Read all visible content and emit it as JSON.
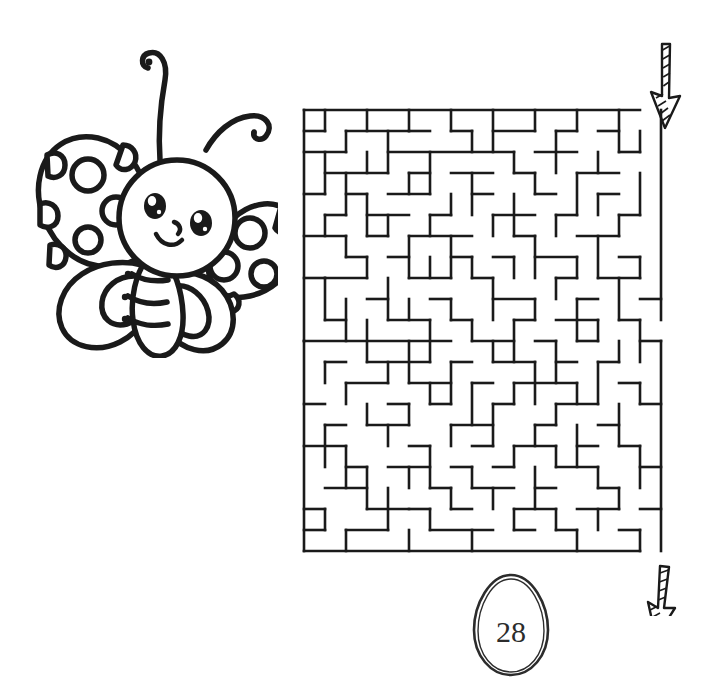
{
  "page": {
    "background_color": "#ffffff",
    "ink_color": "#1a1a1a",
    "width": 724,
    "height": 697
  },
  "illustration": {
    "name": "butterfly",
    "description": "Cartoon butterfly line drawing with polka-dot wings",
    "style": "black outline coloring-book line art",
    "parts": [
      "left-upper-wing-with-spots",
      "right-upper-wing-with-spots",
      "left-lower-wing",
      "right-lower-wing",
      "body-segments",
      "head",
      "left-eye",
      "right-eye",
      "nose",
      "smile",
      "left-antenna-curl",
      "right-antenna-curl"
    ],
    "spot_count_left_wing": 7,
    "spot_count_right_wing": 7
  },
  "maze": {
    "name": "maze-puzzle",
    "columns": 17,
    "rows": 21,
    "cell_size": 21,
    "wall_color": "#1a1a1a",
    "wall_thickness": 2.6,
    "entrance": {
      "label": "entry-arrow",
      "position": "top-right",
      "direction": "down"
    },
    "exit": {
      "label": "exit-arrow",
      "position": "bottom-right",
      "direction": "down"
    },
    "h_walls": [
      [
        0,
        0,
        16
      ],
      [
        0,
        1,
        1
      ],
      [
        2,
        1,
        3
      ],
      [
        5,
        1,
        1
      ],
      [
        7,
        1,
        1
      ],
      [
        9,
        1,
        2
      ],
      [
        12,
        1,
        1
      ],
      [
        14,
        1,
        1
      ],
      [
        0,
        2,
        2
      ],
      [
        4,
        2,
        6
      ],
      [
        11,
        2,
        2
      ],
      [
        15,
        2,
        1
      ],
      [
        1,
        3,
        3
      ],
      [
        5,
        3,
        1
      ],
      [
        7,
        3,
        2
      ],
      [
        10,
        3,
        1
      ],
      [
        13,
        3,
        2
      ],
      [
        0,
        4,
        1
      ],
      [
        2,
        4,
        1
      ],
      [
        4,
        4,
        2
      ],
      [
        8,
        4,
        1
      ],
      [
        11,
        4,
        1
      ],
      [
        14,
        4,
        1
      ],
      [
        1,
        5,
        1
      ],
      [
        3,
        5,
        2
      ],
      [
        6,
        5,
        1
      ],
      [
        9,
        5,
        2
      ],
      [
        12,
        5,
        1
      ],
      [
        15,
        5,
        1
      ],
      [
        0,
        6,
        2
      ],
      [
        3,
        6,
        1
      ],
      [
        5,
        6,
        3
      ],
      [
        10,
        6,
        1
      ],
      [
        13,
        6,
        2
      ],
      [
        2,
        7,
        1
      ],
      [
        4,
        7,
        1
      ],
      [
        7,
        7,
        1
      ],
      [
        9,
        7,
        1
      ],
      [
        11,
        7,
        2
      ],
      [
        15,
        7,
        1
      ],
      [
        0,
        8,
        1
      ],
      [
        1,
        8,
        2
      ],
      [
        5,
        8,
        2
      ],
      [
        8,
        8,
        1
      ],
      [
        12,
        8,
        1
      ],
      [
        14,
        8,
        2
      ],
      [
        3,
        9,
        1
      ],
      [
        6,
        9,
        1
      ],
      [
        9,
        9,
        2
      ],
      [
        13,
        9,
        1
      ],
      [
        16,
        9,
        1
      ],
      [
        1,
        10,
        1
      ],
      [
        4,
        10,
        2
      ],
      [
        7,
        10,
        1
      ],
      [
        10,
        10,
        1
      ],
      [
        12,
        10,
        2
      ],
      [
        15,
        10,
        1
      ],
      [
        0,
        11,
        7
      ],
      [
        8,
        11,
        2
      ],
      [
        11,
        11,
        1
      ],
      [
        13,
        11,
        1
      ],
      [
        16,
        11,
        1
      ],
      [
        1,
        12,
        1
      ],
      [
        3,
        12,
        3
      ],
      [
        7,
        12,
        1
      ],
      [
        9,
        12,
        2
      ],
      [
        12,
        12,
        1
      ],
      [
        14,
        12,
        1
      ],
      [
        2,
        13,
        2
      ],
      [
        5,
        13,
        2
      ],
      [
        8,
        13,
        1
      ],
      [
        10,
        13,
        3
      ],
      [
        15,
        13,
        1
      ],
      [
        0,
        14,
        1
      ],
      [
        4,
        14,
        1
      ],
      [
        6,
        14,
        1
      ],
      [
        9,
        14,
        1
      ],
      [
        12,
        14,
        2
      ],
      [
        16,
        14,
        1
      ],
      [
        1,
        15,
        1
      ],
      [
        3,
        15,
        2
      ],
      [
        7,
        15,
        2
      ],
      [
        11,
        15,
        1
      ],
      [
        14,
        15,
        1
      ],
      [
        0,
        16,
        2
      ],
      [
        5,
        16,
        1
      ],
      [
        8,
        16,
        1
      ],
      [
        10,
        16,
        2
      ],
      [
        13,
        16,
        1
      ],
      [
        15,
        16,
        1
      ],
      [
        2,
        17,
        1
      ],
      [
        4,
        17,
        2
      ],
      [
        7,
        17,
        1
      ],
      [
        9,
        17,
        1
      ],
      [
        12,
        17,
        2
      ],
      [
        16,
        17,
        1
      ],
      [
        1,
        18,
        2
      ],
      [
        6,
        18,
        1
      ],
      [
        8,
        18,
        2
      ],
      [
        11,
        18,
        1
      ],
      [
        14,
        18,
        1
      ],
      [
        0,
        19,
        1
      ],
      [
        3,
        19,
        2
      ],
      [
        5,
        19,
        1
      ],
      [
        7,
        19,
        1
      ],
      [
        10,
        19,
        2
      ],
      [
        13,
        19,
        2
      ],
      [
        16,
        19,
        1
      ],
      [
        0,
        20,
        1
      ],
      [
        2,
        20,
        2
      ],
      [
        6,
        20,
        3
      ],
      [
        10,
        20,
        1
      ],
      [
        12,
        20,
        1
      ],
      [
        15,
        20,
        1
      ],
      [
        0,
        21,
        16
      ]
    ],
    "v_walls": [
      [
        0,
        0,
        11
      ],
      [
        0,
        11,
        10
      ],
      [
        1,
        0,
        1
      ],
      [
        1,
        2,
        2
      ],
      [
        1,
        5,
        1
      ],
      [
        1,
        8,
        2
      ],
      [
        1,
        12,
        1
      ],
      [
        1,
        15,
        2
      ],
      [
        1,
        19,
        1
      ],
      [
        2,
        1,
        1
      ],
      [
        2,
        3,
        2
      ],
      [
        2,
        6,
        1
      ],
      [
        2,
        9,
        2
      ],
      [
        2,
        13,
        1
      ],
      [
        2,
        16,
        2
      ],
      [
        2,
        20,
        1
      ],
      [
        3,
        0,
        1
      ],
      [
        3,
        2,
        1
      ],
      [
        3,
        4,
        2
      ],
      [
        3,
        7,
        1
      ],
      [
        3,
        10,
        2
      ],
      [
        3,
        14,
        1
      ],
      [
        3,
        17,
        2
      ],
      [
        4,
        1,
        2
      ],
      [
        4,
        5,
        1
      ],
      [
        4,
        8,
        2
      ],
      [
        4,
        12,
        1
      ],
      [
        4,
        15,
        1
      ],
      [
        4,
        18,
        2
      ],
      [
        5,
        0,
        1
      ],
      [
        5,
        3,
        1
      ],
      [
        5,
        6,
        2
      ],
      [
        5,
        9,
        1
      ],
      [
        5,
        11,
        2
      ],
      [
        5,
        14,
        1
      ],
      [
        5,
        17,
        1
      ],
      [
        5,
        20,
        1
      ],
      [
        6,
        2,
        2
      ],
      [
        6,
        5,
        1
      ],
      [
        6,
        7,
        1
      ],
      [
        6,
        10,
        2
      ],
      [
        6,
        13,
        1
      ],
      [
        6,
        16,
        2
      ],
      [
        6,
        19,
        1
      ],
      [
        7,
        0,
        1
      ],
      [
        7,
        4,
        1
      ],
      [
        7,
        6,
        2
      ],
      [
        7,
        9,
        1
      ],
      [
        7,
        12,
        2
      ],
      [
        7,
        15,
        1
      ],
      [
        7,
        18,
        1
      ],
      [
        8,
        1,
        1
      ],
      [
        8,
        3,
        2
      ],
      [
        8,
        7,
        1
      ],
      [
        8,
        10,
        1
      ],
      [
        8,
        13,
        2
      ],
      [
        8,
        17,
        1
      ],
      [
        8,
        20,
        1
      ],
      [
        9,
        0,
        2
      ],
      [
        9,
        5,
        1
      ],
      [
        9,
        8,
        2
      ],
      [
        9,
        11,
        1
      ],
      [
        9,
        14,
        2
      ],
      [
        9,
        18,
        1
      ],
      [
        10,
        2,
        1
      ],
      [
        10,
        4,
        2
      ],
      [
        10,
        7,
        1
      ],
      [
        10,
        10,
        2
      ],
      [
        10,
        13,
        1
      ],
      [
        10,
        16,
        1
      ],
      [
        10,
        19,
        1
      ],
      [
        11,
        0,
        1
      ],
      [
        11,
        3,
        1
      ],
      [
        11,
        6,
        2
      ],
      [
        11,
        9,
        1
      ],
      [
        11,
        12,
        2
      ],
      [
        11,
        15,
        1
      ],
      [
        11,
        17,
        2
      ],
      [
        12,
        1,
        2
      ],
      [
        12,
        5,
        1
      ],
      [
        12,
        8,
        1
      ],
      [
        12,
        11,
        2
      ],
      [
        12,
        14,
        1
      ],
      [
        12,
        16,
        1
      ],
      [
        12,
        19,
        1
      ],
      [
        13,
        0,
        1
      ],
      [
        13,
        3,
        2
      ],
      [
        13,
        7,
        1
      ],
      [
        13,
        9,
        2
      ],
      [
        13,
        13,
        1
      ],
      [
        13,
        15,
        2
      ],
      [
        13,
        20,
        1
      ],
      [
        14,
        2,
        1
      ],
      [
        14,
        4,
        1
      ],
      [
        14,
        6,
        2
      ],
      [
        14,
        10,
        1
      ],
      [
        14,
        12,
        2
      ],
      [
        14,
        17,
        1
      ],
      [
        14,
        19,
        1
      ],
      [
        15,
        0,
        2
      ],
      [
        15,
        5,
        1
      ],
      [
        15,
        8,
        2
      ],
      [
        15,
        11,
        1
      ],
      [
        15,
        14,
        2
      ],
      [
        15,
        18,
        1
      ],
      [
        16,
        1,
        1
      ],
      [
        16,
        3,
        2
      ],
      [
        16,
        7,
        1
      ],
      [
        16,
        10,
        2
      ],
      [
        16,
        13,
        1
      ],
      [
        16,
        16,
        2
      ],
      [
        16,
        20,
        1
      ],
      [
        17,
        0,
        10
      ],
      [
        17,
        11,
        10
      ]
    ]
  },
  "page_number": {
    "label": "28",
    "shape": "egg"
  }
}
